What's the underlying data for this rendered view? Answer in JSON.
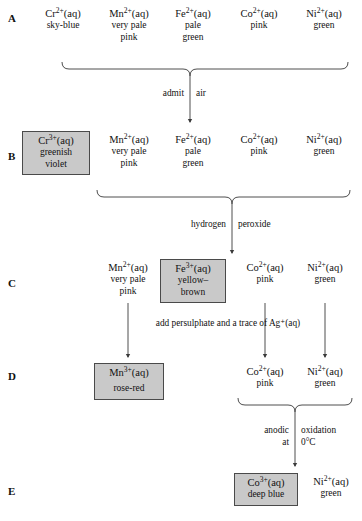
{
  "diagram": {
    "box_fill": "#c9c9c9",
    "box_border": "#4a4a4a",
    "line_color": "#3a3a3a",
    "rows": [
      {
        "letter": "A",
        "species": [
          {
            "formula_element": "Cr",
            "charge": "2+",
            "state": "(aq)",
            "colour_lines": [
              "sky-blue"
            ],
            "boxed": false
          },
          {
            "formula_element": "Mn",
            "charge": "2+",
            "state": "(aq)",
            "colour_lines": [
              "very pale",
              "pink"
            ],
            "boxed": false
          },
          {
            "formula_element": "Fe",
            "charge": "2+",
            "state": "(aq)",
            "colour_lines": [
              "pale",
              "green"
            ],
            "boxed": false
          },
          {
            "formula_element": "Co",
            "charge": "2+",
            "state": "(aq)",
            "colour_lines": [
              "pink"
            ],
            "boxed": false
          },
          {
            "formula_element": "Ni",
            "charge": "2+",
            "state": "(aq)",
            "colour_lines": [
              "green"
            ],
            "boxed": false
          }
        ]
      },
      {
        "letter": "B",
        "species": [
          {
            "formula_element": "Cr",
            "charge": "3+",
            "state": "(aq)",
            "colour_lines": [
              "greenish",
              "violet"
            ],
            "boxed": true
          },
          {
            "formula_element": "Mn",
            "charge": "2+",
            "state": "(aq)",
            "colour_lines": [
              "very pale",
              "pink"
            ],
            "boxed": false
          },
          {
            "formula_element": "Fe",
            "charge": "2+",
            "state": "(aq)",
            "colour_lines": [
              "pale",
              "green"
            ],
            "boxed": false
          },
          {
            "formula_element": "Co",
            "charge": "2+",
            "state": "(aq)",
            "colour_lines": [
              "pink"
            ],
            "boxed": false
          },
          {
            "formula_element": "Ni",
            "charge": "2+",
            "state": "(aq)",
            "colour_lines": [
              "green"
            ],
            "boxed": false
          }
        ]
      },
      {
        "letter": "C",
        "species": [
          {
            "formula_element": "Mn",
            "charge": "2+",
            "state": "(aq)",
            "colour_lines": [
              "very pale",
              "pink"
            ],
            "boxed": false
          },
          {
            "formula_element": "Fe",
            "charge": "3+",
            "state": "(aq)",
            "colour_lines": [
              "yellow–",
              "brown"
            ],
            "boxed": true
          },
          {
            "formula_element": "Co",
            "charge": "2+",
            "state": "(aq)",
            "colour_lines": [
              "pink"
            ],
            "boxed": false
          },
          {
            "formula_element": "Ni",
            "charge": "2+",
            "state": "(aq)",
            "colour_lines": [
              "green"
            ],
            "boxed": false
          }
        ]
      },
      {
        "letter": "D",
        "species": [
          {
            "formula_element": "Mn",
            "charge": "3+",
            "state": "(aq)",
            "colour_lines": [
              "rose-red"
            ],
            "boxed": true
          },
          {
            "formula_element": "Co",
            "charge": "2+",
            "state": "(aq)",
            "colour_lines": [
              "pink"
            ],
            "boxed": false
          },
          {
            "formula_element": "Ni",
            "charge": "2+",
            "state": "(aq)",
            "colour_lines": [
              "green"
            ],
            "boxed": false
          }
        ]
      },
      {
        "letter": "E",
        "species": [
          {
            "formula_element": "Co",
            "charge": "3+",
            "state": "(aq)",
            "colour_lines": [
              "deep blue"
            ],
            "boxed": true
          },
          {
            "formula_element": "Ni",
            "charge": "2+",
            "state": "(aq)",
            "colour_lines": [
              "green"
            ],
            "boxed": false
          }
        ]
      }
    ],
    "reagents": [
      {
        "id": "admit-air",
        "left_text": "admit",
        "right_text": "air"
      },
      {
        "id": "hydrogen-peroxide",
        "left_text": "hydrogen",
        "right_text": "peroxide"
      },
      {
        "id": "persulphate",
        "full_text": "add persulphate and a trace of Ag⁺(aq)"
      },
      {
        "id": "anodic-oxidation",
        "left_lines": [
          "anodic",
          "at"
        ],
        "right_lines": [
          "oxidation",
          "0°C"
        ]
      }
    ]
  }
}
